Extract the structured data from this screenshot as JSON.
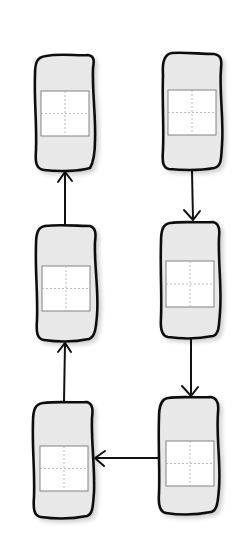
{
  "diagram": {
    "type": "flow-cycle",
    "style": "hand-drawn sketch",
    "colors": {
      "background": "#ffffff",
      "node_fill": "#e8e8e8",
      "node_stroke": "#111111",
      "inner_fill": "#ffffff",
      "inner_stroke": "#777777",
      "crosshair": "#aaaaaa",
      "edge": "#111111"
    },
    "nodes": [
      {
        "id": "n1",
        "column": "right",
        "row": 1,
        "x": 162,
        "y": 53,
        "w": 58,
        "h": 117
      },
      {
        "id": "n2",
        "column": "right",
        "row": 2,
        "x": 161,
        "y": 221,
        "w": 58,
        "h": 117
      },
      {
        "id": "n3",
        "column": "right",
        "row": 3,
        "x": 159,
        "y": 397,
        "w": 58,
        "h": 117
      },
      {
        "id": "n4",
        "column": "left",
        "row": 3,
        "x": 33,
        "y": 402,
        "w": 60,
        "h": 116
      },
      {
        "id": "n5",
        "column": "left",
        "row": 2,
        "x": 36,
        "y": 225,
        "w": 60,
        "h": 117
      },
      {
        "id": "n6",
        "column": "left",
        "row": 1,
        "x": 35,
        "y": 55,
        "w": 59,
        "h": 117
      }
    ],
    "edges": [
      {
        "from": "n1",
        "to": "n2",
        "direction": "down"
      },
      {
        "from": "n2",
        "to": "n3",
        "direction": "down"
      },
      {
        "from": "n3",
        "to": "n4",
        "direction": "left"
      },
      {
        "from": "n4",
        "to": "n5",
        "direction": "up"
      },
      {
        "from": "n5",
        "to": "n6",
        "direction": "up"
      }
    ]
  }
}
